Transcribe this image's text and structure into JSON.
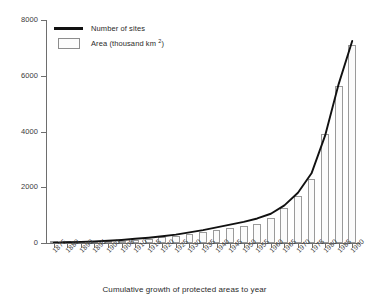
{
  "chart_data": {
    "type": "bar",
    "title": "",
    "xlabel": "Cumulative growth of protected areas to year",
    "ylabel": "",
    "ylim": [
      0,
      8000
    ],
    "yticks": [
      0,
      2000,
      4000,
      6000,
      8000
    ],
    "ytick_labels": [
      "0",
      "2000",
      "4000",
      "6000",
      "8000"
    ],
    "grid": false,
    "legend_position": "top-left",
    "categories": [
      "1875",
      "1880",
      "1890",
      "1895",
      "1900",
      "1905",
      "1910",
      "1915",
      "1920",
      "1925",
      "1930",
      "1935",
      "1940",
      "1945",
      "1950",
      "1955",
      "1960",
      "1965",
      "1970",
      "1975",
      "1980",
      "1985",
      "1990"
    ],
    "series": [
      {
        "name": "Area (thousand km 2)",
        "type": "bar",
        "values": [
          10,
          20,
          30,
          40,
          60,
          90,
          120,
          150,
          200,
          260,
          330,
          400,
          470,
          540,
          620,
          700,
          900,
          1250,
          1700,
          2300,
          3900,
          5650,
          7100
        ]
      },
      {
        "name": "Number of sites",
        "type": "line",
        "values": [
          15,
          25,
          40,
          55,
          80,
          110,
          150,
          190,
          240,
          300,
          380,
          460,
          560,
          660,
          760,
          880,
          1050,
          1350,
          1800,
          2500,
          3850,
          5700,
          7250
        ]
      }
    ],
    "colors": {
      "line": "#111111",
      "bar_fill": "#fbfbfb",
      "bar_stroke": "#9a9a9a",
      "axis": "#6e6e6e",
      "text": "#2a2a2a"
    }
  },
  "legend": {
    "entries": [
      {
        "key": "line",
        "label": "Number of sites",
        "icon": "legend-line-icon"
      },
      {
        "key": "box",
        "label_main": "Area (thousand km ",
        "label_sup": "2",
        "label_tail": ")",
        "icon": "legend-box-icon"
      }
    ]
  },
  "axis_title": {
    "x": "Cumulative growth of protected areas to year"
  }
}
